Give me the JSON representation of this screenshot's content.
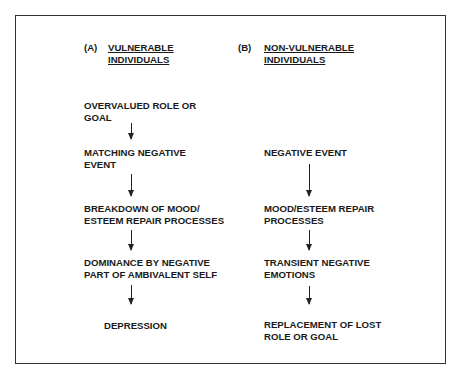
{
  "header_cut_text": "2.4   ...",
  "columns": {
    "a": {
      "tag": "(A)",
      "title_line1": "VULNERABLE",
      "title_line2": "INDIVIDUALS",
      "steps": [
        {
          "line1": "OVERVALUED ROLE OR",
          "line2": "GOAL"
        },
        {
          "line1": "MATCHING NEGATIVE",
          "line2": "EVENT"
        },
        {
          "line1": "BREAKDOWN OF MOOD/",
          "line2": "ESTEEM REPAIR PROCESSES"
        },
        {
          "line1": "DOMINANCE BY NEGATIVE",
          "line2": "PART OF AMBIVALENT SELF"
        },
        {
          "line1": "DEPRESSION",
          "line2": ""
        }
      ]
    },
    "b": {
      "tag": "(B)",
      "title_line1": "NON-VULNERABLE",
      "title_line2": "INDIVIDUALS",
      "steps": [
        {
          "line1": "NEGATIVE EVENT",
          "line2": ""
        },
        {
          "line1": "MOOD/ESTEEM REPAIR",
          "line2": "PROCESSES"
        },
        {
          "line1": "TRANSIENT NEGATIVE",
          "line2": "EMOTIONS"
        },
        {
          "line1": "REPLACEMENT OF LOST",
          "line2": "ROLE OR GOAL"
        }
      ]
    }
  }
}
